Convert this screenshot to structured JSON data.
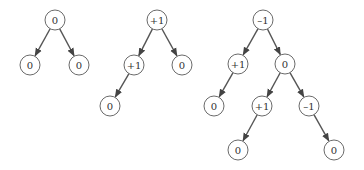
{
  "trees": [
    {
      "name": "tree-1",
      "nodes": [
        {
          "id": "a",
          "label": "0",
          "x": 55,
          "y": 20
        },
        {
          "id": "b",
          "label": "0",
          "x": 30,
          "y": 65
        },
        {
          "id": "c",
          "label": "0",
          "x": 79,
          "y": 65
        }
      ],
      "edges": [
        [
          "a",
          "b"
        ],
        [
          "a",
          "c"
        ]
      ]
    },
    {
      "name": "tree-2",
      "nodes": [
        {
          "id": "a",
          "label": "+1",
          "x": 157,
          "y": 20
        },
        {
          "id": "b",
          "label": "+1",
          "x": 134,
          "y": 65
        },
        {
          "id": "c",
          "label": "0",
          "x": 182,
          "y": 65
        },
        {
          "id": "d",
          "label": "0",
          "x": 110,
          "y": 106
        }
      ],
      "edges": [
        [
          "a",
          "b"
        ],
        [
          "a",
          "c"
        ],
        [
          "b",
          "d"
        ]
      ]
    },
    {
      "name": "tree-3",
      "nodes": [
        {
          "id": "a",
          "label": "–1",
          "x": 263,
          "y": 20
        },
        {
          "id": "b",
          "label": "+1",
          "x": 238,
          "y": 64
        },
        {
          "id": "c",
          "label": "0",
          "x": 285,
          "y": 64
        },
        {
          "id": "d",
          "label": "0",
          "x": 214,
          "y": 106
        },
        {
          "id": "e",
          "label": "+1",
          "x": 262,
          "y": 106
        },
        {
          "id": "f",
          "label": "–1",
          "x": 309,
          "y": 106
        },
        {
          "id": "g",
          "label": "0",
          "x": 238,
          "y": 150
        },
        {
          "id": "h",
          "label": "0",
          "x": 334,
          "y": 150
        }
      ],
      "edges": [
        [
          "a",
          "b"
        ],
        [
          "a",
          "c"
        ],
        [
          "b",
          "d"
        ],
        [
          "c",
          "e"
        ],
        [
          "c",
          "f"
        ],
        [
          "e",
          "g"
        ],
        [
          "f",
          "h"
        ]
      ]
    }
  ],
  "style": {
    "node_radius": 10,
    "edge_color": "#555555",
    "node_stroke": "#6a6a6a"
  }
}
